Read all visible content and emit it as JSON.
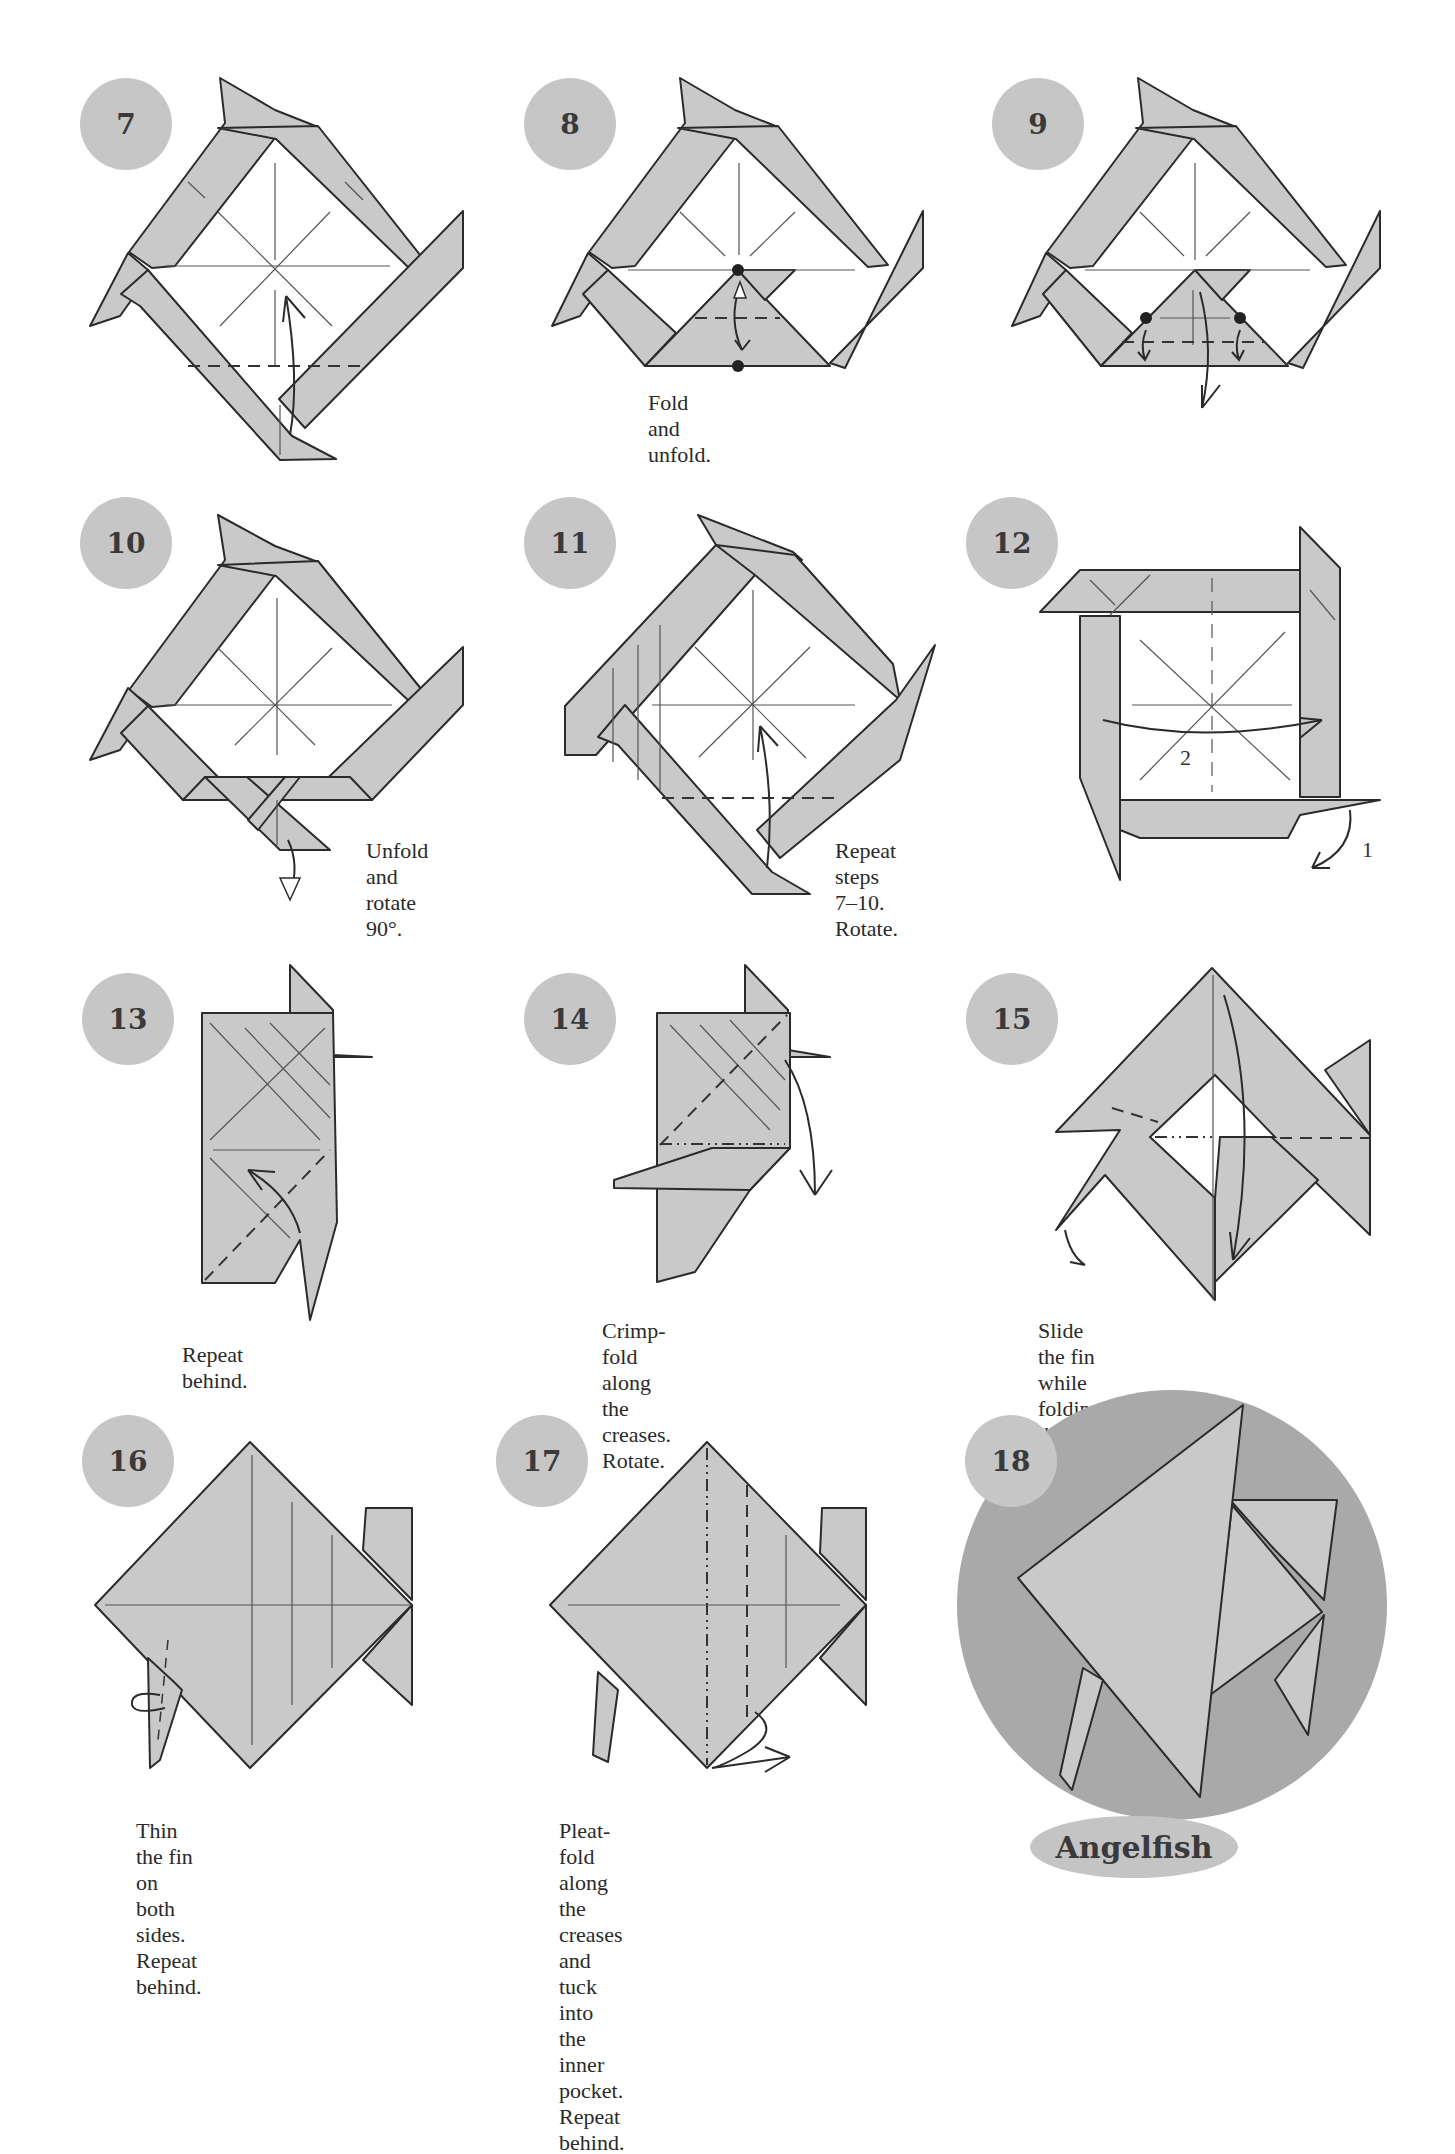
{
  "page": {
    "model_title": "Angelfish",
    "colors": {
      "paper": "#c9c9c9",
      "badge": "#c6c6c6",
      "final_circle": "#a9a9a9",
      "lines": "#2b2b2b"
    }
  },
  "steps": [
    {
      "number": "7",
      "caption": ""
    },
    {
      "number": "8",
      "caption": "Fold and unfold."
    },
    {
      "number": "9",
      "caption": ""
    },
    {
      "number": "10",
      "caption": "Unfold and\nrotate 90°."
    },
    {
      "number": "11",
      "caption": "Repeat steps 7–10.\nRotate."
    },
    {
      "number": "12",
      "caption": "",
      "labels": [
        "2",
        "1"
      ]
    },
    {
      "number": "13",
      "caption": "Repeat behind."
    },
    {
      "number": "14",
      "caption": "Crimp-fold along the\ncreases. Rotate."
    },
    {
      "number": "15",
      "caption": "Slide the fin while folding the\ntop layer down. Repeat behind."
    },
    {
      "number": "16",
      "caption": "Thin the fin on both\nsides. Repeat behind."
    },
    {
      "number": "17",
      "caption": "Pleat-fold along the creases\nand tuck into the inner\npocket. Repeat behind."
    },
    {
      "number": "18",
      "caption": "Angelfish"
    }
  ],
  "icons": {
    "step_7": [
      "valley-fold-line",
      "curved-arrow-up"
    ],
    "step_8": [
      "reference-dot",
      "valley-fold-line",
      "fold-unfold-arrow"
    ],
    "step_9": [
      "reference-dot",
      "valley-fold-line",
      "curved-arrow-down"
    ],
    "step_10": [
      "unfold-arrow"
    ],
    "step_11": [
      "valley-fold-line",
      "curved-arrow-up"
    ],
    "step_12": [
      "valley-fold-line",
      "curved-arrow"
    ],
    "step_13": [
      "valley-fold-line",
      "curved-arrow"
    ],
    "step_14": [
      "mountain-fold-line",
      "valley-fold-line",
      "curved-arrow"
    ],
    "step_15": [
      "mountain-fold-line",
      "valley-fold-line",
      "curved-arrow"
    ],
    "step_16": [
      "crease-line",
      "rotate-arrow"
    ],
    "step_17": [
      "mountain-fold-line",
      "valley-fold-line",
      "pleat-arrow"
    ]
  }
}
